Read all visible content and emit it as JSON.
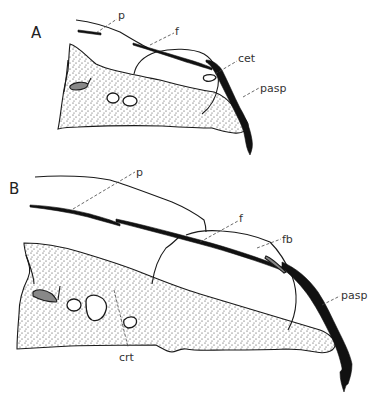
{
  "figure": {
    "panels": [
      {
        "id": "A",
        "label": "A",
        "annotations": {
          "p": "p",
          "f": "f",
          "cet": "cet",
          "pasp": "pasp"
        }
      },
      {
        "id": "B",
        "label": "B",
        "annotations": {
          "p": "p",
          "f": "f",
          "fb": "fb",
          "pasp": "pasp",
          "crt": "crt"
        }
      }
    ]
  }
}
